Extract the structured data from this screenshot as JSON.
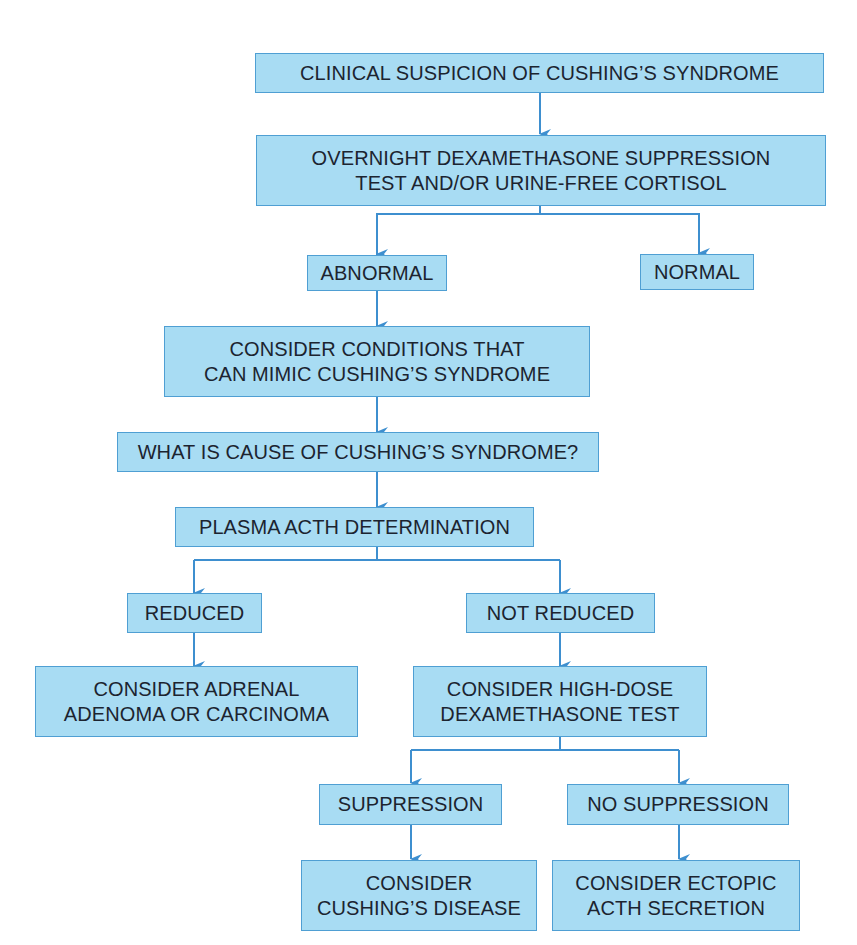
{
  "flowchart": {
    "nodes": [
      {
        "id": "clinical_suspicion",
        "label": "CLINICAL SUSPICION OF CUSHING’S SYNDROME"
      },
      {
        "id": "screening_test",
        "label": "OVERNIGHT DEXAMETHASONE SUPPRESSION\nTEST AND/OR URINE-FREE CORTISOL"
      },
      {
        "id": "abnormal",
        "label": "ABNORMAL"
      },
      {
        "id": "normal",
        "label": "NORMAL"
      },
      {
        "id": "consider_mimic",
        "label": "CONSIDER CONDITIONS THAT\nCAN MIMIC CUSHING’S SYNDROME"
      },
      {
        "id": "what_cause",
        "label": "WHAT IS CAUSE OF CUSHING’S SYNDROME?"
      },
      {
        "id": "plasma_acth",
        "label": "PLASMA ACTH DETERMINATION"
      },
      {
        "id": "reduced",
        "label": "REDUCED"
      },
      {
        "id": "not_reduced",
        "label": "NOT REDUCED"
      },
      {
        "id": "adrenal",
        "label": "CONSIDER ADRENAL\nADENOMA OR CARCINOMA"
      },
      {
        "id": "high_dose",
        "label": "CONSIDER HIGH-DOSE\nDEXAMETHASONE TEST"
      },
      {
        "id": "suppression",
        "label": "SUPPRESSION"
      },
      {
        "id": "no_suppression",
        "label": "NO SUPPRESSION"
      },
      {
        "id": "cushings_disease",
        "label": "CONSIDER\nCUSHING’S DISEASE"
      },
      {
        "id": "ectopic",
        "label": "CONSIDER ECTOPIC\nACTH SECRETION"
      }
    ],
    "edges": [
      [
        "clinical_suspicion",
        "screening_test"
      ],
      [
        "screening_test",
        "abnormal"
      ],
      [
        "screening_test",
        "normal"
      ],
      [
        "abnormal",
        "consider_mimic"
      ],
      [
        "consider_mimic",
        "what_cause"
      ],
      [
        "what_cause",
        "plasma_acth"
      ],
      [
        "plasma_acth",
        "reduced"
      ],
      [
        "plasma_acth",
        "not_reduced"
      ],
      [
        "reduced",
        "adrenal"
      ],
      [
        "not_reduced",
        "high_dose"
      ],
      [
        "high_dose",
        "suppression"
      ],
      [
        "high_dose",
        "no_suppression"
      ],
      [
        "suppression",
        "cushings_disease"
      ],
      [
        "no_suppression",
        "ectopic"
      ]
    ],
    "colors": {
      "box_fill": "#a8dcf3",
      "box_border": "#4f9fd3",
      "arrow": "#3e8fcf",
      "text": "#1c2430"
    }
  }
}
